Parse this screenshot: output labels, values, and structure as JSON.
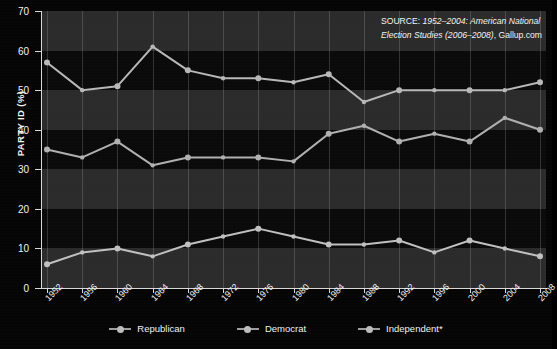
{
  "chart_data": {
    "type": "line",
    "title": "",
    "xlabel": "",
    "ylabel": "PARTY ID (%)",
    "ylim": [
      0,
      70
    ],
    "ytick_step": 10,
    "yticks": [
      0,
      10,
      20,
      30,
      40,
      50,
      60,
      70
    ],
    "grid": "horizontal-bands-and-vertical-lines",
    "legend_position": "bottom-center",
    "categories": [
      "1952",
      "1956",
      "1960",
      "1964",
      "1968",
      "1972",
      "1976",
      "1980",
      "1984",
      "1988",
      "1992",
      "1996",
      "2000",
      "2004",
      "2008"
    ],
    "series": [
      {
        "name": "Republican",
        "color": "#b0b0b0",
        "values": [
          35,
          33,
          37,
          31,
          33,
          33,
          33,
          32,
          39,
          41,
          37,
          39,
          37,
          43,
          40
        ]
      },
      {
        "name": "Democrat",
        "color": "#b8b8b8",
        "values": [
          57,
          50,
          51,
          61,
          55,
          53,
          53,
          52,
          54,
          47,
          50,
          50,
          50,
          50,
          52
        ]
      },
      {
        "name": "Independent*",
        "color": "#c0c0c0",
        "values": [
          6,
          9,
          10,
          8,
          11,
          13,
          15,
          13,
          11,
          11,
          12,
          9,
          12,
          10,
          8
        ]
      }
    ],
    "annotations": [
      {
        "name": "source-note",
        "line1_lead": "SOURCE: ",
        "line1_italic": "1952–2004: American National",
        "line2_italic": "Election Studies (2006–2008)",
        "line2_tail": ", Gallup.com"
      }
    ]
  },
  "legend": {
    "items": [
      {
        "label": "Republican"
      },
      {
        "label": "Democrat"
      },
      {
        "label": "Independent*"
      }
    ]
  },
  "colors": {
    "background": "#050505",
    "plot_background": "#0a0a0a",
    "band": "#2b2b2b",
    "axis": "#d8d8d8",
    "text": "#f2f2f2",
    "line": "#b4b4b4"
  }
}
